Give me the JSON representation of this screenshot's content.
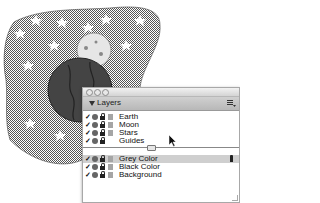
{
  "artwork": {
    "description": "Space illustration with stars, moon and earth on a dotted grey background",
    "objects": [
      "background-blob",
      "stars",
      "moon",
      "earth"
    ]
  },
  "panel": {
    "title": "Layers",
    "menu_icon": "panel-options-icon",
    "groups": [
      {
        "layers": [
          {
            "name": "Earth",
            "visible": true,
            "locked": true,
            "swatch": true
          },
          {
            "name": "Moon",
            "visible": true,
            "locked": true,
            "swatch": true
          },
          {
            "name": "Stars",
            "visible": true,
            "locked": true,
            "swatch": true
          },
          {
            "name": "Guides",
            "visible": true,
            "locked": true,
            "swatch": false
          }
        ]
      },
      {
        "layers": [
          {
            "name": "Grey Color",
            "visible": true,
            "locked": true,
            "swatch": true,
            "selected": true,
            "active_pen": true
          },
          {
            "name": "Black Color",
            "visible": true,
            "locked": true,
            "swatch": true
          },
          {
            "name": "Background",
            "visible": true,
            "locked": true,
            "swatch": true
          }
        ]
      }
    ]
  },
  "colors": {
    "selection": "#cfcfcf",
    "swatch": "#a5a5a5",
    "pattern": "#8a8a8a"
  }
}
